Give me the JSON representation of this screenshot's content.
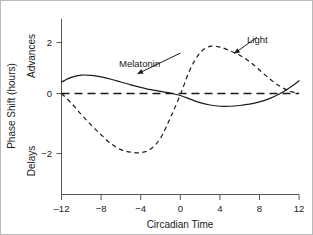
{
  "chart_data": {
    "type": "line",
    "title": "",
    "xlabel": "Circadian Time",
    "ylabel": "Phase Shift (hours)",
    "ylabel_top": "Advances",
    "ylabel_bottom": "Delays",
    "xlim": [
      -12,
      12
    ],
    "ylim": [
      -3.1,
      2.9
    ],
    "xticks": [
      -12,
      -8,
      -4,
      0,
      4,
      8,
      12
    ],
    "xtick_labels": [
      "‒12",
      "−8",
      "−4",
      "0",
      "4",
      "8",
      "12"
    ],
    "yticks": [
      2,
      0,
      -2
    ],
    "ytick_labels": [
      "2",
      "0",
      "−2"
    ],
    "grid": false,
    "legend": "annotations",
    "reference_line": {
      "name": "zero-line",
      "y": 0,
      "style": "dashed"
    },
    "annotations": [
      {
        "text": "Melatonin",
        "series": "Melatonin",
        "x": 0.2,
        "y": 1.62,
        "points_to_x": -4.6,
        "points_to_y": 0.72
      },
      {
        "text": "Light",
        "series": "Light",
        "x": 7.9,
        "y": 2.25,
        "points_to_x": 5.2,
        "points_to_y": 1.5
      }
    ],
    "series": [
      {
        "name": "Melatonin",
        "style": "solid",
        "color": "#1a1a1a",
        "x": [
          -12,
          -11,
          -10,
          -9,
          -8,
          -7,
          -6,
          -5,
          -4,
          -3,
          -2,
          -1,
          0,
          1,
          2,
          3,
          4,
          5,
          6,
          7,
          8,
          9,
          10,
          11,
          12
        ],
        "values": [
          0.45,
          0.63,
          0.72,
          0.71,
          0.65,
          0.56,
          0.45,
          0.34,
          0.24,
          0.15,
          0.08,
          0.02,
          -0.08,
          -0.22,
          -0.36,
          -0.45,
          -0.5,
          -0.5,
          -0.47,
          -0.42,
          -0.33,
          -0.2,
          -0.02,
          0.22,
          0.5
        ]
      },
      {
        "name": "Light",
        "style": "dashed",
        "color": "#1a1a1a",
        "x": [
          -12,
          -11,
          -10,
          -9,
          -8,
          -7,
          -6,
          -5,
          -4,
          -3,
          -2,
          -1,
          0,
          1,
          2,
          3,
          4,
          5,
          6,
          7,
          8,
          9,
          10,
          11,
          12
        ],
        "values": [
          0.0,
          -0.38,
          -0.82,
          -1.24,
          -1.62,
          -1.97,
          -2.2,
          -2.3,
          -2.32,
          -2.18,
          -1.75,
          -0.95,
          -0.05,
          0.95,
          1.6,
          1.85,
          1.82,
          1.68,
          1.5,
          1.25,
          0.92,
          0.58,
          0.3,
          0.1,
          0.0
        ]
      }
    ]
  }
}
